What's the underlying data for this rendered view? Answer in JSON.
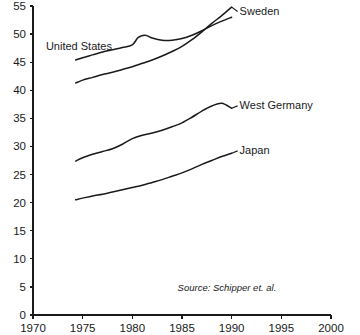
{
  "chart_data": {
    "type": "line",
    "title": "",
    "subtitle": "",
    "xlabel": "",
    "ylabel": "",
    "xlim": [
      1970,
      2000
    ],
    "ylim": [
      0,
      55
    ],
    "grid": false,
    "legend_position": "inline-right-of-line-end",
    "x_ticks": [
      1970,
      1975,
      1980,
      1985,
      1990,
      1995,
      2000
    ],
    "x_tick_labels": [
      "1970",
      "1975",
      "1980",
      "1985",
      "1990",
      "1995",
      "2000"
    ],
    "y_ticks": [
      0,
      5,
      10,
      15,
      20,
      25,
      30,
      35,
      40,
      45,
      50,
      55
    ],
    "y_tick_labels": [
      "0",
      "5",
      "10",
      "15",
      "20",
      "25",
      "30",
      "35",
      "40",
      "45",
      "50",
      "55"
    ],
    "annotations": [
      {
        "name": "source-note",
        "text": "Source: Schipper et. al.",
        "x": 1994.5,
        "y": 4.2
      }
    ],
    "series": [
      {
        "name": "United States",
        "label": "United States",
        "label_position": "left-above-line",
        "label_x": 1971.3,
        "label_y": 47.2,
        "color": "#1a1a1a",
        "x": [
          1974.3,
          1975,
          1976,
          1977,
          1978,
          1979,
          1980,
          1980.6,
          1981.3,
          1982,
          1983,
          1984,
          1985,
          1986,
          1987,
          1988,
          1989,
          1990
        ],
        "values": [
          45.4,
          45.8,
          46.3,
          46.8,
          47.2,
          47.6,
          48.1,
          49.4,
          49.8,
          49.3,
          48.9,
          48.9,
          49.2,
          49.8,
          50.6,
          51.5,
          52.3,
          53.0
        ]
      },
      {
        "name": "Sweden",
        "label": "Sweden",
        "label_position": "right-of-line-end",
        "label_x": 1990.8,
        "label_y": 53.4,
        "color": "#1a1a1a",
        "x": [
          1974.3,
          1975,
          1976,
          1977,
          1978,
          1979,
          1980,
          1981,
          1982,
          1983,
          1984,
          1985,
          1986,
          1987,
          1988,
          1989,
          1990
        ],
        "values": [
          41.3,
          41.8,
          42.3,
          42.8,
          43.2,
          43.7,
          44.2,
          44.8,
          45.4,
          46.1,
          46.9,
          47.8,
          49.0,
          50.4,
          51.9,
          53.3,
          54.8
        ]
      },
      {
        "name": "West Germany",
        "label": "West Germany",
        "label_position": "right-of-line-end",
        "label_x": 1990.8,
        "label_y": 36.6,
        "color": "#1a1a1a",
        "x": [
          1974.3,
          1975,
          1976,
          1977,
          1978,
          1979,
          1980,
          1981,
          1982,
          1983,
          1984,
          1985,
          1986,
          1987,
          1988,
          1989,
          1990
        ],
        "values": [
          27.4,
          28.0,
          28.6,
          29.1,
          29.6,
          30.4,
          31.4,
          32.0,
          32.4,
          32.9,
          33.5,
          34.2,
          35.2,
          36.3,
          37.2,
          37.7,
          36.8
        ]
      },
      {
        "name": "Japan",
        "label": "Japan",
        "label_position": "right-of-line-end",
        "label_x": 1990.8,
        "label_y": 28.6,
        "color": "#1a1a1a",
        "x": [
          1974.3,
          1975,
          1976,
          1977,
          1978,
          1979,
          1980,
          1981,
          1982,
          1983,
          1984,
          1985,
          1986,
          1987,
          1988,
          1989,
          1990
        ],
        "values": [
          20.5,
          20.8,
          21.2,
          21.5,
          21.9,
          22.3,
          22.7,
          23.1,
          23.6,
          24.1,
          24.7,
          25.3,
          26.0,
          26.8,
          27.5,
          28.2,
          28.8
        ]
      }
    ]
  }
}
